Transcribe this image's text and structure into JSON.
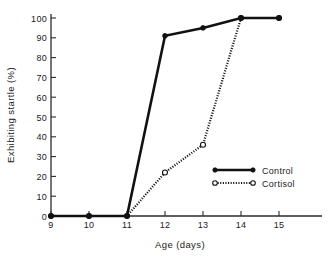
{
  "chart_data": {
    "type": "line",
    "title": "",
    "xlabel": "Age  (days)",
    "ylabel": "Exhibiting startle (%)",
    "x": [
      9,
      10,
      11,
      12,
      13,
      14,
      15
    ],
    "xtick_labels": [
      "9",
      "10",
      "11",
      "12",
      "13",
      "14",
      "15"
    ],
    "ytick_labels": [
      "0",
      "10",
      "20",
      "30",
      "40",
      "50",
      "60",
      "70",
      "80",
      "90",
      "100"
    ],
    "ytick_values": [
      0,
      10,
      20,
      30,
      40,
      50,
      60,
      70,
      80,
      90,
      100
    ],
    "xlim": [
      8.6,
      15.9
    ],
    "ylim": [
      0,
      100
    ],
    "grid": false,
    "legend_position": "center-right",
    "series": [
      {
        "name": "Control",
        "values": [
          0,
          0,
          0,
          91,
          95,
          100,
          100
        ],
        "line_style": "solid",
        "marker": "filled-circle",
        "color": "#111111"
      },
      {
        "name": "Cortisol",
        "values": [
          0,
          0,
          0,
          22,
          36,
          100,
          100
        ],
        "line_style": "dotted",
        "marker": "open-circle",
        "color": "#111111"
      }
    ],
    "annotations": []
  },
  "legend": {
    "entries": [
      {
        "label": "Control"
      },
      {
        "label": "Cortisol"
      }
    ]
  },
  "colors": {
    "ink": "#111111",
    "axis": "#2b2b2b",
    "background": "#ffffff"
  }
}
